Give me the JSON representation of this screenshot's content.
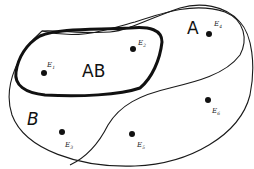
{
  "diagram": {
    "type": "venn-diagram",
    "regions": {
      "A": {
        "label": "A"
      },
      "AB": {
        "label": "AB"
      },
      "B": {
        "label": "B"
      }
    },
    "points": [
      {
        "id": "E1",
        "letter": "E",
        "sub": "1",
        "region": "AB"
      },
      {
        "id": "E2",
        "letter": "E",
        "sub": "2",
        "region": "AB"
      },
      {
        "id": "E3",
        "letter": "E",
        "sub": "3",
        "region": "B"
      },
      {
        "id": "E4",
        "letter": "E",
        "sub": "4",
        "region": "A"
      },
      {
        "id": "E5",
        "letter": "E",
        "sub": "5",
        "region": "outer"
      },
      {
        "id": "E6",
        "letter": "E",
        "sub": "6",
        "region": "outer"
      }
    ],
    "colors": {
      "stroke": "#111111",
      "background": "#ffffff"
    }
  }
}
